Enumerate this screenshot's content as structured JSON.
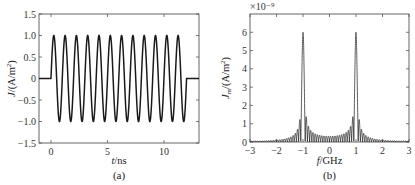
{
  "chart_data": [
    {
      "id": "a",
      "type": "line",
      "panel_label": "(a)",
      "title": "",
      "xlabel": "t/ns",
      "ylabel": "J/(A/m²)",
      "xlim": [
        -1.06,
        13.1
      ],
      "ylim": [
        -1.5,
        1.5
      ],
      "xticks": [
        0,
        5,
        10
      ],
      "xtick_labels": [
        "0",
        "5",
        "10"
      ],
      "yticks": [
        1.5,
        1.0,
        0.5,
        0,
        -0.5,
        -1.0,
        -1.5
      ],
      "ytick_labels": [
        "1.5",
        "1.0",
        "0.5",
        "0",
        "−0.5",
        "−1.0",
        "−1.5"
      ],
      "grid": false,
      "legend": null,
      "series": [
        {
          "name": "J(t)",
          "description": "gated sinusoid: 0 for t<0, sin(2π·1GHz·t) for 0≤t≤12 ns, 0 for t>12 ns",
          "frequency_GHz": 1.0,
          "amplitude": 1.0,
          "t_start_ns": 0,
          "t_end_ns": 12,
          "cycles": 12,
          "sample_points": {
            "t": [
              -1,
              0,
              0.25,
              0.5,
              0.75,
              1.0,
              6.25,
              6.75,
              11.25,
              11.75,
              12,
              13
            ],
            "J": [
              0,
              0,
              1.0,
              0,
              -1.0,
              0,
              1.0,
              -1.0,
              1.0,
              -1.0,
              0,
              0
            ]
          }
        }
      ],
      "color": "#1a1a1a"
    },
    {
      "id": "b",
      "type": "line",
      "panel_label": "(b)",
      "title": "",
      "xlabel": "f/GHz",
      "ylabel": "Jm/(A/m²)",
      "y_multiplier": "×10⁻⁹",
      "xlim": [
        -3,
        3
      ],
      "ylim": [
        0,
        7
      ],
      "xticks": [
        -3,
        -2,
        -1,
        0,
        1,
        2,
        3
      ],
      "xtick_labels": [
        "−3",
        "−2",
        "−1",
        "0",
        "1",
        "2",
        "3"
      ],
      "yticks": [
        0,
        1,
        2,
        3,
        4,
        5,
        6
      ],
      "ytick_labels": [
        "0",
        "1",
        "2",
        "3",
        "4",
        "5",
        "6"
      ],
      "grid": false,
      "legend": null,
      "series": [
        {
          "name": "|Jm(f)|",
          "description": "magnitude spectrum of the 12-cycle gated sinusoid; symmetric peaks at ±1 GHz with dense sidelobes",
          "peaks": [
            {
              "f_GHz": -1.0,
              "value_e-9": 6.0
            },
            {
              "f_GHz": 1.0,
              "value_e-9": 6.0
            }
          ],
          "sample_envelope": {
            "f": [
              -3,
              -2,
              -1.5,
              -1.2,
              -1.1,
              -1.0,
              -0.9,
              -0.8,
              -0.5,
              0,
              0.5,
              0.8,
              0.9,
              1.0,
              1.1,
              1.2,
              1.5,
              2,
              3
            ],
            "value_e-9": [
              0.05,
              0.1,
              0.2,
              0.5,
              1.2,
              6.0,
              1.3,
              0.7,
              0.3,
              0.2,
              0.3,
              0.7,
              1.3,
              6.0,
              1.2,
              0.5,
              0.2,
              0.1,
              0.05
            ]
          }
        }
      ],
      "color": "#1a1a1a"
    }
  ],
  "panels": {
    "a": {
      "label": "(a)"
    },
    "b": {
      "label": "(b)",
      "multiplier": "×10⁻⁹"
    }
  }
}
